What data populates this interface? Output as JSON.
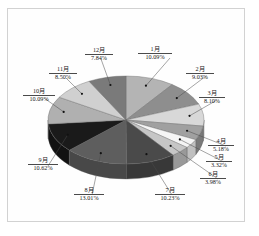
{
  "figure": {
    "background_color": "#ffffff",
    "frame_color": "#d2d2d2",
    "chart_type_label": "3D pie chart"
  },
  "chart_data": {
    "type": "pie",
    "title": "",
    "subtitle": "",
    "xlabel": "",
    "ylabel": "",
    "legend_position": "none",
    "grid": false,
    "three_d": true,
    "start_angle_deg": -90,
    "direction": "clockwise",
    "labels_show_name_and_percent": true,
    "categories": [
      "1月",
      "2月",
      "3月",
      "4月",
      "5月",
      "6月",
      "7月",
      "8月",
      "9月",
      "10月",
      "11月",
      "12月"
    ],
    "values": [
      10.09,
      9.03,
      8.1,
      5.18,
      3.32,
      3.98,
      10.23,
      13.01,
      10.62,
      10.09,
      8.5,
      7.84
    ],
    "percent_labels": [
      "10.09%",
      "9.03%",
      "8.10%",
      "5.18%",
      "3.32%",
      "3.98%",
      "10.23%",
      "13.01%",
      "10.62%",
      "10.09%",
      "8.50%",
      "7.84%"
    ],
    "total": 99.99,
    "unit": "%",
    "slice_colors": [
      "#b4b4b4",
      "#8e8e8e",
      "#d8d8d8",
      "#a0a0a0",
      "#f5f5f5",
      "#c6c6c6",
      "#4a4a4a",
      "#5e5e5e",
      "#1a1a1a",
      "#b0b0b0",
      "#d0d0d0",
      "#7a7a7a"
    ],
    "slice_side_colors": [
      "#8a8a8a",
      "#6c6c6c",
      "#a6a6a6",
      "#7a7a7a",
      "#c0c0c0",
      "#999999",
      "#383838",
      "#484848",
      "#121212",
      "#868686",
      "#a0a0a0",
      "#5c5c5c"
    ],
    "slices": [
      {
        "name": "1月",
        "percent": "10.09%",
        "value": 10.09,
        "color": "#b4b4b4"
      },
      {
        "name": "2月",
        "percent": "9.03%",
        "value": 9.03,
        "color": "#8e8e8e"
      },
      {
        "name": "3月",
        "percent": "8.10%",
        "value": 8.1,
        "color": "#d8d8d8"
      },
      {
        "name": "4月",
        "percent": "5.18%",
        "value": 5.18,
        "color": "#a0a0a0"
      },
      {
        "name": "5月",
        "percent": "3.32%",
        "value": 3.32,
        "color": "#f5f5f5"
      },
      {
        "name": "6月",
        "percent": "3.98%",
        "value": 3.98,
        "color": "#c6c6c6"
      },
      {
        "name": "7月",
        "percent": "10.23%",
        "value": 10.23,
        "color": "#4a4a4a"
      },
      {
        "name": "8月",
        "percent": "13.01%",
        "value": 13.01,
        "color": "#5e5e5e"
      },
      {
        "name": "9月",
        "percent": "10.62%",
        "value": 10.62,
        "color": "#1a1a1a"
      },
      {
        "name": "10月",
        "percent": "10.09%",
        "value": 10.09,
        "color": "#b0b0b0"
      },
      {
        "name": "11月",
        "percent": "8.50%",
        "value": 8.5,
        "color": "#d0d0d0"
      },
      {
        "name": "12月",
        "percent": "7.84%",
        "value": 7.84,
        "color": "#7a7a7a"
      }
    ]
  },
  "labels": {
    "jan": {
      "name": "1月",
      "percent": "10.09%"
    },
    "feb": {
      "name": "2月",
      "percent": "9.03%"
    },
    "mar": {
      "name": "3月",
      "percent": "8.10%"
    },
    "apr": {
      "name": "4月",
      "percent": "5.18%"
    },
    "may": {
      "name": "5月",
      "percent": "3.32%"
    },
    "jun": {
      "name": "6月",
      "percent": "3.98%"
    },
    "jul": {
      "name": "7月",
      "percent": "10.23%"
    },
    "aug": {
      "name": "8月",
      "percent": "13.01%"
    },
    "sep": {
      "name": "9月",
      "percent": "10.62%"
    },
    "oct": {
      "name": "10月",
      "percent": "10.09%"
    },
    "nov": {
      "name": "11月",
      "percent": "8.50%"
    },
    "dec": {
      "name": "12月",
      "percent": "7.84%"
    }
  }
}
